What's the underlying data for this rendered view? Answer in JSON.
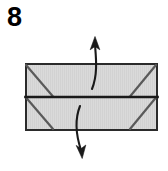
{
  "figure": {
    "step_label": "8",
    "title": "",
    "caption": ""
  },
  "colors": {
    "paper_fill": "#d9d9d9",
    "paper_edge": "#2b2b2b",
    "crease_line": "#5a5a5a",
    "fold_line": "#1a1a1a",
    "arrow": "#1a1a1a",
    "background": "#ffffff",
    "label_text": "#000000"
  },
  "shapes": {
    "paper_rectangle": {
      "name": "folded-paper-rectangle",
      "x": 25,
      "y": 63,
      "width": 133,
      "height": 68,
      "stroke_width": 2
    },
    "horizontal_fold": {
      "name": "center-horizontal-fold",
      "x1": 25,
      "y1": 97,
      "x2": 158,
      "y2": 97,
      "stroke_width": 2.6
    },
    "creases": [
      {
        "name": "crease-top-left",
        "x1": 25,
        "y1": 64,
        "x2": 53,
        "y2": 97,
        "stroke_width": 2.2
      },
      {
        "name": "crease-top-right",
        "x1": 157,
        "y1": 64,
        "x2": 130,
        "y2": 97,
        "stroke_width": 2.2
      },
      {
        "name": "crease-bottom-left",
        "x1": 25,
        "y1": 97,
        "x2": 53,
        "y2": 130,
        "stroke_width": 2.2
      },
      {
        "name": "crease-bottom-right",
        "x1": 157,
        "y1": 97,
        "x2": 130,
        "y2": 130,
        "stroke_width": 2.2
      }
    ]
  },
  "arrows": [
    {
      "name": "fold-up-arrow",
      "direction": "up",
      "label": "",
      "path": "M 92 89 C 98 74 96 58 95 45",
      "head": "M 95 37 L 90.4 49.5 L 95 46.6 L 99.6 49.5 Z",
      "stroke_width": 2.1
    },
    {
      "name": "fold-down-arrow",
      "direction": "down",
      "label": "",
      "path": "M 80 106 C 74 121 77 138 81 150",
      "head": "M 82 158 L 76.6 145.8 L 81.3 148.4 L 85.6 145.2 Z",
      "stroke_width": 2.1
    }
  ]
}
